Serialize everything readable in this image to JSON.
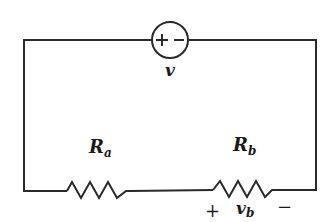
{
  "diagram": {
    "type": "series circuit",
    "source": {
      "label": "v",
      "polarity_plus": "+",
      "polarity_minus": "−"
    },
    "resistor_a": {
      "label_main": "R",
      "label_sub": "a"
    },
    "resistor_b": {
      "label_main": "R",
      "label_sub": "b",
      "voltage_label_main": "v",
      "voltage_label_sub": "b",
      "polarity_plus": "+",
      "polarity_minus": "−"
    },
    "colors": {
      "line": "#2a2a2a",
      "text": "#1a1a1a",
      "background": "#ffffff"
    }
  }
}
